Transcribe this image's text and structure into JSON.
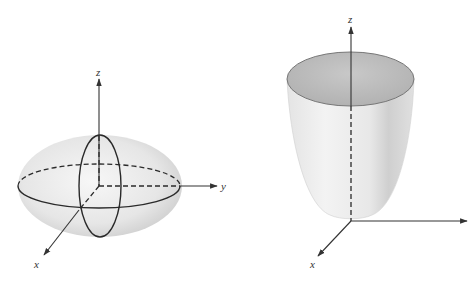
{
  "figures": [
    {
      "name": "ellipsoid",
      "axes": {
        "z": "z",
        "y": "y",
        "x": "x"
      }
    },
    {
      "name": "elliptic-paraboloid",
      "axes": {
        "z": "z",
        "x": "x"
      }
    }
  ],
  "colors": {
    "surface_light": "#f2f2f2",
    "surface_mid": "#dcdcdc",
    "surface_dark": "#bdbdbd",
    "line": "#2a2a2a"
  }
}
